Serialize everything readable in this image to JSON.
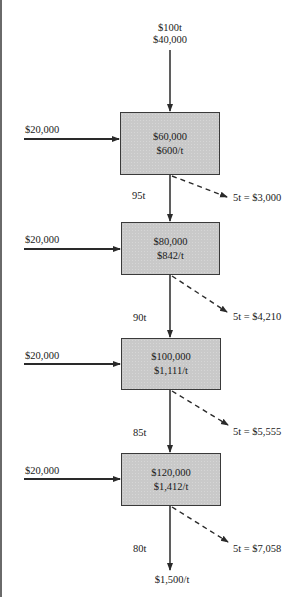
{
  "diagram": {
    "top_input": {
      "line1": "$100t",
      "line2": "$40,000"
    },
    "stages": [
      {
        "cost": "$60,000",
        "unit_cost": "$600/t",
        "added_input": "$20,000",
        "output_qty": "95t",
        "loss": "5t = $3,000"
      },
      {
        "cost": "$80,000",
        "unit_cost": "$842/t",
        "added_input": "$20,000",
        "output_qty": "90t",
        "loss": "5t = $4,210"
      },
      {
        "cost": "$100,000",
        "unit_cost": "$1,111/t",
        "added_input": "$20,000",
        "output_qty": "85t",
        "loss": "5t = $5,555"
      },
      {
        "cost": "$120,000",
        "unit_cost": "$1,412/t",
        "added_input": "$20,000",
        "output_qty": "80t",
        "loss": "5t = $7,058"
      }
    ],
    "final_output": "$1,500/t",
    "colors": {
      "box_fill": "#c9c9c9",
      "line": "#2a2a2a"
    }
  }
}
